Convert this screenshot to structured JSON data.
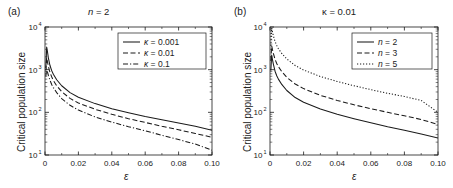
{
  "figure": {
    "background": "#ffffff",
    "line_color": "#1a1a1a"
  },
  "panels": [
    {
      "id": "a",
      "label": "(a)",
      "title": "n = 2",
      "title_italic_part": "n",
      "xlabel": "ε",
      "ylabel": "Critical population size",
      "legend": [
        {
          "label": "κ = 0.001",
          "style": "solid"
        },
        {
          "label": "κ = 0.01",
          "style": "dashed"
        },
        {
          "label": "κ = 0.1",
          "style": "dashdot"
        }
      ]
    },
    {
      "id": "b",
      "label": "(b)",
      "title": "κ = 0.01",
      "xlabel": "ε",
      "ylabel": "Critical population size",
      "legend": [
        {
          "label": "n = 2",
          "style": "solid"
        },
        {
          "label": "n = 3",
          "style": "dashed"
        },
        {
          "label": "n = 5",
          "style": "dotted"
        }
      ]
    }
  ],
  "axes": {
    "x_ticks": [
      "0",
      "0.02",
      "0.04",
      "0.06",
      "0.08",
      "0.10"
    ],
    "x_values": [
      0,
      0.02,
      0.04,
      0.06,
      0.08,
      0.1
    ],
    "y_ticks": [
      "10",
      "10",
      "10",
      "10"
    ],
    "y_exponents": [
      "1",
      "2",
      "3",
      "4"
    ],
    "y_values": [
      10,
      100,
      1000,
      10000
    ]
  },
  "chart_data": {
    "type": "line",
    "xlabel": "ε",
    "ylabel": "Critical population size",
    "xlim": [
      0,
      0.1
    ],
    "ylim": [
      10,
      10000
    ],
    "yscale": "log",
    "grid": false,
    "legend_position": "top-right",
    "panels": [
      {
        "panel": "a",
        "title": "n = 2",
        "series": [
          {
            "name": "κ = 0.001",
            "style": "solid",
            "x": [
              0.0005,
              0.001,
              0.0015,
              0.002,
              0.003,
              0.004,
              0.005,
              0.007,
              0.01,
              0.015,
              0.02,
              0.03,
              0.04,
              0.05,
              0.06,
              0.07,
              0.08,
              0.09,
              0.1
            ],
            "y": [
              1100,
              3400,
              2600,
              1900,
              1250,
              950,
              780,
              580,
              420,
              290,
              225,
              160,
              122,
              98,
              80,
              67,
              56,
              47,
              38
            ]
          },
          {
            "name": "κ = 0.01",
            "style": "dashed",
            "x": [
              0.0005,
              0.001,
              0.0015,
              0.002,
              0.003,
              0.004,
              0.005,
              0.007,
              0.01,
              0.015,
              0.02,
              0.03,
              0.04,
              0.05,
              0.06,
              0.07,
              0.08,
              0.09,
              0.1
            ],
            "y": [
              950,
              1900,
              1500,
              1200,
              860,
              680,
              560,
              420,
              305,
              212,
              165,
              118,
              90,
              71,
              58,
              47,
              39,
              32,
              26
            ]
          },
          {
            "name": "κ = 0.1",
            "style": "dashdot",
            "x": [
              0.0005,
              0.001,
              0.0015,
              0.002,
              0.003,
              0.004,
              0.005,
              0.007,
              0.01,
              0.015,
              0.02,
              0.03,
              0.04,
              0.05,
              0.06,
              0.07,
              0.08,
              0.09,
              0.1
            ],
            "y": [
              700,
              1050,
              880,
              740,
              560,
              450,
              380,
              290,
              210,
              146,
              113,
              78,
              59,
              46,
              37,
              29,
              23,
              18,
              13
            ]
          }
        ]
      },
      {
        "panel": "b",
        "title": "κ = 0.01",
        "series": [
          {
            "name": "n = 2",
            "style": "solid",
            "x": [
              0.0005,
              0.001,
              0.0015,
              0.002,
              0.003,
              0.004,
              0.005,
              0.007,
              0.01,
              0.015,
              0.02,
              0.03,
              0.04,
              0.05,
              0.06,
              0.07,
              0.08,
              0.09,
              0.1
            ],
            "y": [
              950,
              2200,
              1700,
              1350,
              920,
              720,
              600,
              450,
              325,
              222,
              172,
              120,
              90,
              71,
              57,
              46,
              38,
              31,
              25
            ]
          },
          {
            "name": "n = 3",
            "style": "dashed",
            "x": [
              0.0005,
              0.001,
              0.0015,
              0.002,
              0.003,
              0.004,
              0.005,
              0.007,
              0.01,
              0.015,
              0.02,
              0.03,
              0.04,
              0.05,
              0.06,
              0.07,
              0.08,
              0.09,
              0.1
            ],
            "y": [
              1600,
              3600,
              2900,
              2400,
              1750,
              1400,
              1180,
              900,
              660,
              460,
              360,
              250,
              190,
              150,
              122,
              100,
              83,
              68,
              52
            ]
          },
          {
            "name": "n = 5",
            "style": "dotted",
            "x": [
              0.0005,
              0.001,
              0.0015,
              0.002,
              0.003,
              0.004,
              0.005,
              0.007,
              0.01,
              0.015,
              0.02,
              0.03,
              0.04,
              0.05,
              0.06,
              0.07,
              0.08,
              0.09,
              0.1
            ],
            "y": [
              3600,
              9500,
              7600,
              6200,
              4600,
              3700,
              3100,
              2400,
              1780,
              1250,
              980,
              690,
              530,
              420,
              340,
              280,
              235,
              190,
              100
            ]
          }
        ]
      }
    ]
  }
}
